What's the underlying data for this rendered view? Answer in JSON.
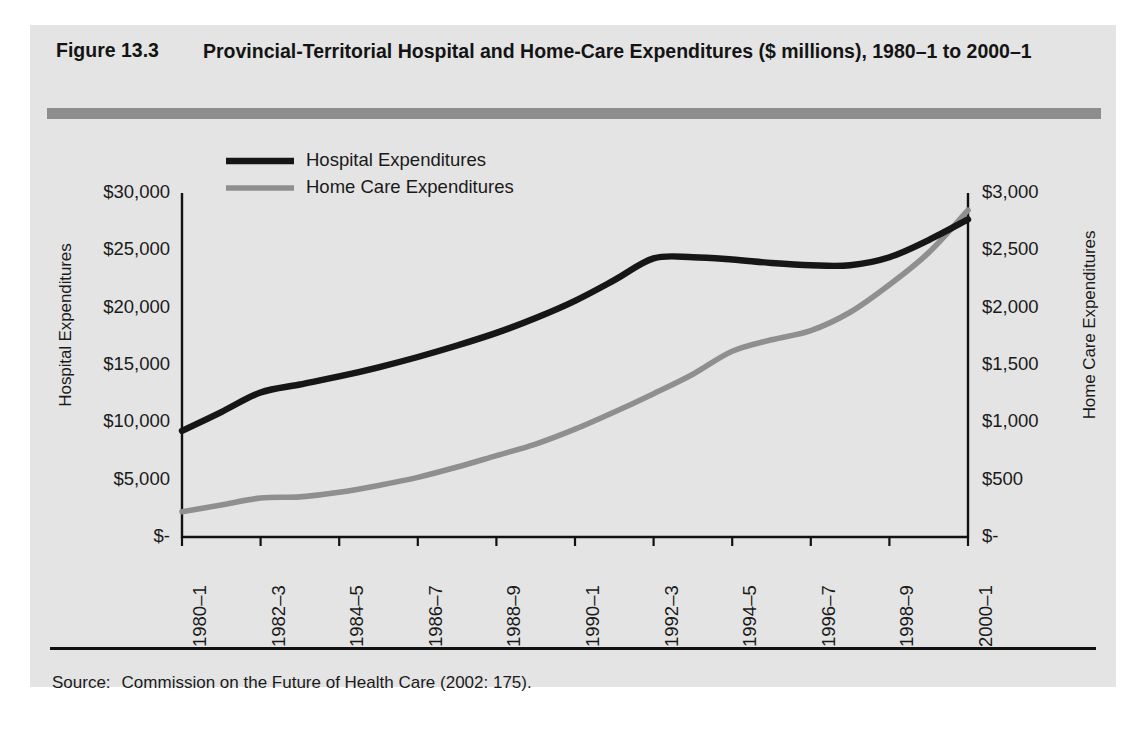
{
  "figure": {
    "number": "Figure 13.3",
    "title": "Provincial-Territorial Hospital and Home-Care Expenditures ($ millions), 1980–1 to 2000–1",
    "source_label": "Source:",
    "source_text": "Commission on the Future of Health Care (2002: 175)."
  },
  "colors": {
    "panel_background": "#e4e4e4",
    "page_background": "#ffffff",
    "rule_gray": "#8d8d8d",
    "axis_black": "#111111",
    "hospital_line": "#161616",
    "home_care_line": "#8f8f8f",
    "text": "#1a1a1a"
  },
  "chart_data": {
    "type": "line",
    "title": "Provincial-Territorial Hospital and Home-Care Expenditures ($ millions), 1980–1 to 2000–1",
    "xlabel": "",
    "ylabel": "Hospital Expenditures",
    "y2label": "Home Care Expenditures",
    "grid": false,
    "legend_position": "upper-left-inside",
    "x": [
      "1980–1",
      "1981–2",
      "1982–3",
      "1983–4",
      "1984–5",
      "1985–6",
      "1986–7",
      "1987–8",
      "1988–9",
      "1989–90",
      "1990–1",
      "1991–2",
      "1992–3",
      "1993–4",
      "1994–5",
      "1995–6",
      "1996–7",
      "1997–8",
      "1998–9",
      "1999–2000",
      "2000–1"
    ],
    "xtick_labels": [
      "1980–1",
      "1982–3",
      "1984–5",
      "1986–7",
      "1988–9",
      "1990–1",
      "1992–3",
      "1994–5",
      "1996–7",
      "1998–9",
      "2000–1"
    ],
    "xtick_indices": [
      0,
      2,
      4,
      6,
      8,
      10,
      12,
      14,
      16,
      18,
      20
    ],
    "ylim": [
      0,
      30000
    ],
    "yticks": [
      0,
      5000,
      10000,
      15000,
      20000,
      25000,
      30000
    ],
    "ytick_labels": [
      "$-",
      "$5,000",
      "$10,000",
      "$15,000",
      "$20,000",
      "$25,000",
      "$30,000"
    ],
    "y2lim": [
      0,
      3000
    ],
    "y2ticks": [
      0,
      500,
      1000,
      1500,
      2000,
      2500,
      3000
    ],
    "y2tick_labels": [
      "$-",
      "$500",
      "$1,000",
      "$1,500",
      "$2,000",
      "$2,500",
      "$3,000"
    ],
    "series": [
      {
        "name": "Hospital Expenditures",
        "axis": "left",
        "color": "#161616",
        "values": [
          9250,
          10900,
          12600,
          13300,
          14000,
          14800,
          15700,
          16700,
          17800,
          19100,
          20600,
          22400,
          24300,
          24400,
          24200,
          23900,
          23700,
          23700,
          24400,
          25900,
          27700
        ]
      },
      {
        "name": "Home Care Expenditures",
        "axis": "right",
        "color": "#8f8f8f",
        "values": [
          220,
          280,
          340,
          350,
          390,
          450,
          520,
          610,
          710,
          810,
          940,
          1090,
          1250,
          1420,
          1620,
          1720,
          1800,
          1960,
          2200,
          2480,
          2850
        ]
      }
    ]
  }
}
